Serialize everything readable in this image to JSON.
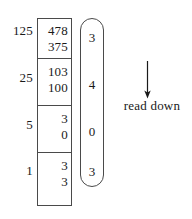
{
  "diagram": {
    "type": "base-conversion-long-division",
    "place_values": [
      "125",
      "25",
      "5",
      "1"
    ],
    "rows": [
      {
        "place": "125",
        "dividend": "478",
        "subtrahend": "375"
      },
      {
        "place": "25",
        "dividend": "103",
        "subtrahend": "100"
      },
      {
        "place": "5",
        "dividend": "3",
        "subtrahend": "0"
      },
      {
        "place": "1",
        "dividend": "3",
        "subtrahend": "3"
      }
    ],
    "result_digits": [
      "3",
      "4",
      "0",
      "3"
    ],
    "annotation": {
      "label": "read down",
      "arrow": "down-arrow"
    },
    "colors": {
      "ink": "#1a1a1a",
      "rule": "#4a4a4a",
      "background": "#ffffff"
    }
  }
}
